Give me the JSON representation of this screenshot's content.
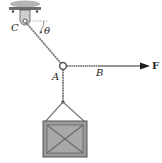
{
  "figure": {
    "labels": {
      "support": "C",
      "angle": "θ",
      "joint": "A",
      "cable_point": "B",
      "force": "F"
    },
    "colors": {
      "rope": "#777777",
      "cable": "#333333",
      "crate_fill": "#9a9a9a",
      "crate_edge": "#555555",
      "ceiling": "#8c8c8c"
    }
  }
}
